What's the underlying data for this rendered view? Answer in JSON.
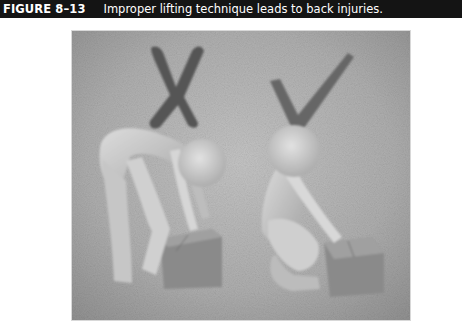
{
  "figure": {
    "label": "FIGURE 8–13",
    "caption": "Improper lifting technique leads to back injuries."
  },
  "illustration": {
    "description": "Two white 3D mannequin figures lifting cardboard boxes on a textured gray background",
    "left_panel": {
      "mark": "x-mark",
      "meaning": "incorrect",
      "pose": "bending at the waist with straight legs to lift box"
    },
    "right_panel": {
      "mark": "check-mark",
      "meaning": "correct",
      "pose": "squatting with bent knees and straight back to lift box"
    }
  },
  "colors": {
    "caption_bar_bg": "#141414",
    "caption_text": "#ffffff",
    "photo_bg": "#a8a8a8",
    "mark_color": "#555555",
    "figure_color": "#d4d4d4",
    "box_color": "#8e8e8e"
  }
}
